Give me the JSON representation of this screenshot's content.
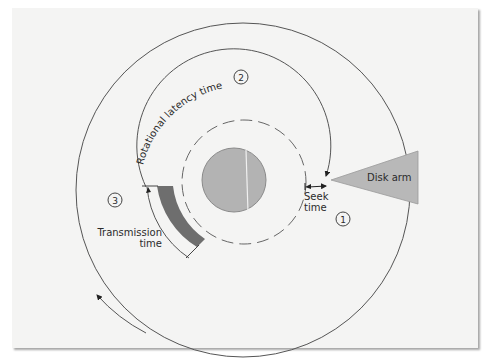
{
  "diagram": {
    "labels": {
      "rotational_latency": "Rotational latency time",
      "disk_arm": "Disk arm",
      "seek_line1": "Seek",
      "seek_line2": "time",
      "transmission_line1": "Transmission",
      "transmission_line2": "time"
    },
    "steps": {
      "step1": "1",
      "step2": "2",
      "step3": "3"
    },
    "colors": {
      "panel_bg": "#f4f4f3",
      "hub_fill": "#b3b3b3",
      "disk_arm_fill": "#b8b8b8",
      "sector_fill": "#6e6e6e",
      "line": "#4a4a4a"
    }
  }
}
